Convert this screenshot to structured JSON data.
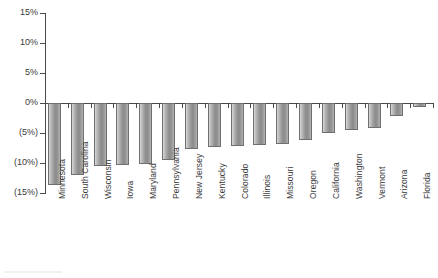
{
  "chart_data": {
    "type": "bar",
    "title": "",
    "subtitle": "",
    "xlabel": "",
    "ylabel": "",
    "ylim": [
      -15,
      15
    ],
    "ytick_values": [
      15,
      10,
      5,
      0,
      -5,
      -10,
      -15
    ],
    "ytick_labels": [
      "15%",
      "10%",
      "5%",
      "0%",
      "(5%)",
      "(10%)",
      "(15%)"
    ],
    "grid": false,
    "legend": null,
    "orientation": "vertical",
    "bar_color": "#9a9a9a",
    "bar_border_color": "#6f6f6f",
    "axis_color": "#4a4a4a",
    "categories": [
      "Minnesota",
      "South Carolina",
      "Wisconsin",
      "Iowa",
      "Maryland",
      "Pennsylvania",
      "New Jersey",
      "Kentucky",
      "Colorado",
      "Illinois",
      "Missouri",
      "Oregon",
      "California",
      "Washington",
      "Vermont",
      "Arizona",
      "Florida"
    ],
    "values": [
      -13.7,
      -12.0,
      -10.5,
      -10.3,
      -10.2,
      -9.5,
      -7.6,
      -7.4,
      -7.2,
      -7.0,
      -6.9,
      -6.1,
      -5.0,
      -4.5,
      -4.2,
      -2.2,
      -0.6
    ],
    "value_labels": [
      "(13.7%)",
      "(12.0%)",
      "(10.5%)",
      "(10.3%)",
      "(10.2%)",
      "(9.5%)",
      "(7.6%)",
      "(7.4%)",
      "(7.2%)",
      "(7.0%)",
      "(6.9%)",
      "(6.1%)",
      "(5.0%)",
      "(4.5%)",
      "(4.2%)",
      "(2.2%)",
      "(0.6%)"
    ]
  }
}
